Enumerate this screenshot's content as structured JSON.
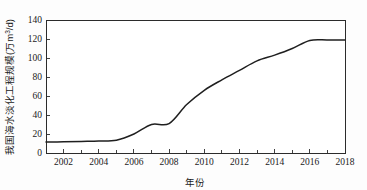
{
  "chart_data": {
    "type": "line",
    "title": "",
    "xlabel": "年份",
    "ylabel": "我国海水淡化工程规模(万m³/d)",
    "ylabel_parts": {
      "text_main": "我国海水淡化工程规模(万m",
      "superscript": "3",
      "text_tail": "/d)"
    },
    "xlim": [
      2001,
      2018
    ],
    "ylim": [
      0,
      140
    ],
    "grid": false,
    "legend": null,
    "x_tick_labels": [
      "2002",
      "2004",
      "2006",
      "2008",
      "2010",
      "2012",
      "2014",
      "2016",
      "2018"
    ],
    "x_tick_values": [
      2002,
      2004,
      2006,
      2008,
      2010,
      2012,
      2014,
      2016,
      2018
    ],
    "x_minor_ticks": [
      2001,
      2003,
      2005,
      2007,
      2009,
      2011,
      2013,
      2015,
      2017
    ],
    "y_tick_labels": [
      "0",
      "20",
      "40",
      "60",
      "80",
      "100",
      "120",
      "140"
    ],
    "y_tick_values": [
      0,
      20,
      40,
      60,
      80,
      100,
      120,
      140
    ],
    "x": [
      2001,
      2002,
      2003,
      2004,
      2005,
      2006,
      2007,
      2008,
      2009,
      2010,
      2011,
      2012,
      2013,
      2014,
      2015,
      2016,
      2017,
      2018
    ],
    "values": [
      11.5,
      11.8,
      12.2,
      12.6,
      13.5,
      20.0,
      30.0,
      31.0,
      51.0,
      66.0,
      77.0,
      87.0,
      97.0,
      103.0,
      110.0,
      118.5,
      119.0,
      119.0
    ],
    "series": [
      {
        "name": "我国海水淡化工程规模",
        "values": [
          11.5,
          11.8,
          12.2,
          12.6,
          13.5,
          20.0,
          30.0,
          31.0,
          51.0,
          66.0,
          77.0,
          87.0,
          97.0,
          103.0,
          110.0,
          118.5,
          119.0,
          119.0
        ],
        "color": "#1f1f1f"
      }
    ],
    "line_color": "#1f1f1f"
  }
}
